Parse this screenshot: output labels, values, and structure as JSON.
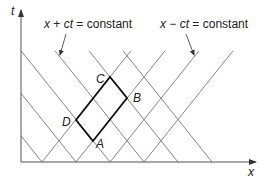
{
  "diagram": {
    "axes": {
      "x_label": "x",
      "y_label": "t"
    },
    "families": [
      {
        "label_x": "x",
        "label_op": " + ",
        "label_ct": "ct",
        "label_rest": " = constant",
        "direction": "down-right",
        "axis_intercepts": [
          42,
          76,
          110,
          144,
          178,
          212
        ]
      },
      {
        "label_x": "x",
        "label_op": " − ",
        "label_ct": "ct",
        "label_rest": " = constant",
        "direction": "up-right",
        "axis_intercepts": [
          42,
          76,
          110,
          144
        ]
      }
    ],
    "vertices": [
      {
        "name": "A",
        "x": 93,
        "y": 141
      },
      {
        "name": "B",
        "x": 127,
        "y": 98
      },
      {
        "name": "C",
        "x": 110,
        "y": 77
      },
      {
        "name": "D",
        "x": 76,
        "y": 120
      }
    ],
    "colors": {
      "grid_line": "#777777",
      "axis": "#555555",
      "parallelogram": "#111111",
      "text": "#222222"
    }
  }
}
